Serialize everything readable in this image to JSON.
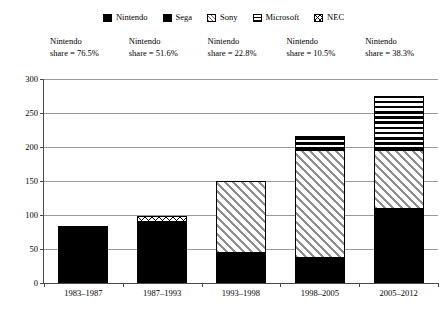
{
  "chart_data": {
    "type": "bar",
    "subtype": "stacked-bar",
    "title": "",
    "xlabel": "",
    "ylabel": "",
    "ylim": [
      0,
      300
    ],
    "ytick_step": 50,
    "yticks": [
      "0",
      "50",
      "100",
      "150",
      "200",
      "250",
      "300"
    ],
    "grid": true,
    "legend_position": "top-center",
    "categories": [
      "1983–1987",
      "1987–1993",
      "1993–1998",
      "1998–2005",
      "2005–2012"
    ],
    "series": [
      {
        "name": "Nintendo",
        "pattern": "solid-black",
        "values": [
          62,
          49,
          33,
          22,
          107
        ]
      },
      {
        "name": "Sega",
        "pattern": "circles",
        "values": [
          19,
          40,
          9,
          13,
          0
        ]
      },
      {
        "name": "Sony",
        "pattern": "diagonal-hatch",
        "values": [
          0,
          0,
          105,
          157,
          85
        ]
      },
      {
        "name": "Microsoft",
        "pattern": "horizontal-stripes",
        "values": [
          0,
          0,
          0,
          22,
          80
        ]
      },
      {
        "name": "NEC",
        "pattern": "zigzag",
        "values": [
          0,
          7,
          0,
          0,
          0
        ]
      }
    ],
    "totals": [
      81,
      96,
      147,
      214,
      272
    ],
    "annotations": [
      "Nintendo\nshare = 76.5%",
      "Nintendo\nshare = 51.6%",
      "Nintendo\nshare = 22.8%",
      "Nintendo\nshare = 10.5%",
      "Nintendo\nshare = 38.3%"
    ]
  },
  "legend": {
    "items": [
      {
        "label": "Nintendo",
        "icon": "legend-swatch-nintendo",
        "pattern_class": "pat-nintendo"
      },
      {
        "label": "Sega",
        "icon": "legend-swatch-sega",
        "pattern_class": "pat-sega"
      },
      {
        "label": "Sony",
        "icon": "legend-swatch-sony",
        "pattern_class": "pat-sony"
      },
      {
        "label": "Microsoft",
        "icon": "legend-swatch-microsoft",
        "pattern_class": "pat-microsoft"
      },
      {
        "label": "NEC",
        "icon": "legend-swatch-nec",
        "pattern_class": "pat-nec"
      }
    ]
  },
  "annotations": [
    {
      "line1": "Nintendo",
      "line2": "share = 76.5%"
    },
    {
      "line1": "Nintendo",
      "line2": "share = 51.6%"
    },
    {
      "line1": "Nintendo",
      "line2": "share = 22.8%"
    },
    {
      "line1": "Nintendo",
      "line2": "share = 10.5%"
    },
    {
      "line1": "Nintendo",
      "line2": "share = 38.3%"
    }
  ],
  "colors": {
    "axis": "#4a4a4a",
    "gridline": "#9a9a9a",
    "text": "#000000",
    "background": "#ffffff",
    "nintendo_fill": "#000000",
    "sony_fill": "#e3e3e3"
  }
}
